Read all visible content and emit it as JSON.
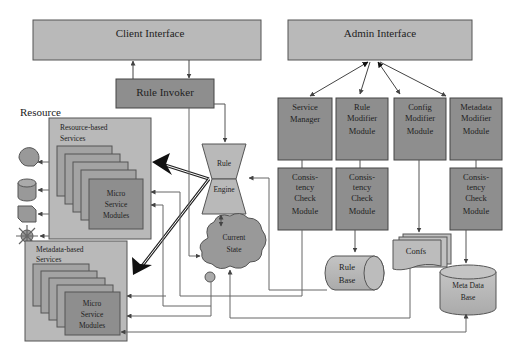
{
  "diagram": {
    "client_interface": "Client Interface",
    "admin_interface": "Admin Interface",
    "rule_invoker": "Rule Invoker",
    "resource_label": "Resource",
    "resource_services": {
      "title_line1": "Resource-based",
      "title_line2": "Services",
      "modules_line1": "Micro",
      "modules_line2": "Service",
      "modules_line3": "Modules"
    },
    "metadata_services": {
      "title_line1": "Metadata-based",
      "title_line2": "Services",
      "modules_line1": "Micro",
      "modules_line2": "Service",
      "modules_line3": "Modules"
    },
    "rule_engine": {
      "line1": "Rule",
      "line2": "Engine"
    },
    "current_state": {
      "line1": "Current",
      "line2": "State"
    },
    "admin_modules": [
      {
        "line1": "Service",
        "line2": "Manager",
        "line3": ""
      },
      {
        "line1": "Rule",
        "line2": "Modifier",
        "line3": "Module"
      },
      {
        "line1": "Config",
        "line2": "Modifier",
        "line3": "Module"
      },
      {
        "line1": "Metadata",
        "line2": "Modifier",
        "line3": "Module"
      }
    ],
    "consistency_modules": [
      {
        "line1": "Consis-",
        "line2": "tency",
        "line3": "Check",
        "line4": "Module"
      },
      {
        "line1": "Consis-",
        "line2": "tency",
        "line3": "Check",
        "line4": "Module"
      },
      {
        "line1": "Consis-",
        "line2": "tency",
        "line3": "Check",
        "line4": "Module"
      }
    ],
    "rule_base": {
      "line1": "Rule",
      "line2": "Base"
    },
    "confs": "Confs",
    "meta_data_base": {
      "line1": "Meta Data",
      "line2": "Base"
    },
    "resource_icons": [
      "head-icon",
      "database-icon",
      "cube-icon",
      "sun-icon"
    ],
    "colors": {
      "light_box": "#b9b9b9",
      "dark_box": "#8e8e8e",
      "line": "#555555"
    }
  }
}
